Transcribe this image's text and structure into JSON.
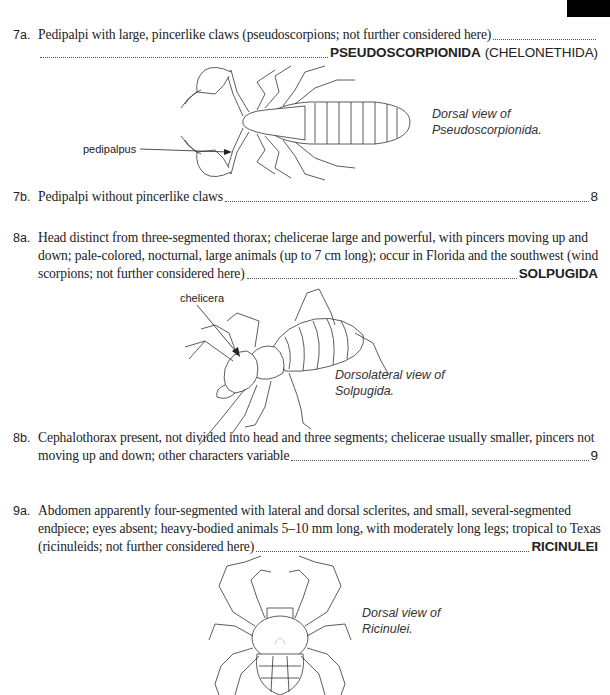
{
  "page_marker": "black-tab",
  "couplets": [
    {
      "number": "7a.",
      "lines": [
        "Pedipalpi with large, pincerlike claws (pseudoscorpions; not further considered here)"
      ],
      "taxon": "PSEUDOSCORPIONIDA",
      "taxon_alt": "(CHELONETHIDA)",
      "figure": {
        "subject": "pseudoscorpion",
        "caption_lines": [
          "Dorsal view of",
          "Pseudoscorpionida."
        ],
        "label": "pedipalpus"
      }
    },
    {
      "number": "7b.",
      "lines": [
        "Pedipalpi without pincerlike claws"
      ],
      "lead": "8"
    },
    {
      "number": "8a.",
      "lines": [
        "Head distinct from three-segmented thorax; chelicerae large and powerful, with pincers moving up and",
        "down; pale-colored, nocturnal, large animals (up to 7 cm long); occur in Florida and the southwest (wind",
        "scorpions; not further considered here)"
      ],
      "taxon": "SOLPUGIDA",
      "figure": {
        "subject": "solpugid",
        "caption_lines": [
          "Dorsolateral view of",
          "Solpugida."
        ],
        "label": "chelicera"
      }
    },
    {
      "number": "8b.",
      "lines": [
        "Cephalothorax present, not divided into head and three segments; chelicerae usually smaller, pincers not",
        "moving up and down; other characters variable"
      ],
      "lead": "9"
    },
    {
      "number": "9a.",
      "lines": [
        "Abdomen apparently four-segmented with lateral and dorsal sclerites, and small, several-segmented",
        "endpiece; eyes absent; heavy-bodied animals 5–10 mm long, with moderately long legs; tropical to Texas",
        "(ricinuleids; not further considered here)"
      ],
      "taxon": "RICINULEI",
      "figure": {
        "subject": "ricinuleid",
        "caption_lines": [
          "Dorsal view of",
          "Ricinulei."
        ]
      }
    }
  ]
}
